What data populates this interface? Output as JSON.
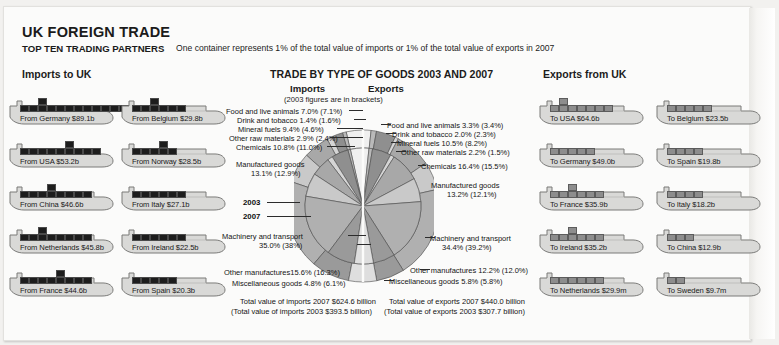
{
  "header": {
    "title": "UK FOREIGN TRADE",
    "subtitle_bold": "TOP TEN TRADING PARTNERS",
    "subtitle_rest": "One container represents 1% of the total value of imports or 1% of the total value of exports in 2007",
    "imports_heading": "Imports to UK",
    "exports_heading": "Exports from UK"
  },
  "chart_header": {
    "title": "TRADE BY TYPE OF GOODS 2003 AND 2007",
    "imports_label": "Imports",
    "exports_label": "Exports",
    "note": "(2003 figures are in brackets)",
    "year_inner": "2007",
    "year_outer": "2003"
  },
  "imports_ships": [
    {
      "label": "From Germany $89.1b",
      "value": 89.1,
      "containers": 13,
      "peak_col": 2,
      "peak_extra": 1
    },
    {
      "label": "From USA $53.2b",
      "value": 53.2,
      "containers": 9,
      "peak_col": 5,
      "peak_extra": 1
    },
    {
      "label": "From China $46.6b",
      "value": 46.6,
      "containers": 8,
      "peak_col": 3,
      "peak_extra": 1
    },
    {
      "label": "From Netherlands $45.8b",
      "value": 45.8,
      "containers": 8,
      "peak_col": 2,
      "peak_extra": 1
    },
    {
      "label": "From France $44.6b",
      "value": 44.6,
      "containers": 8,
      "peak_col": 4,
      "peak_extra": 1
    },
    {
      "label": "From Belgium $29.8b",
      "value": 29.8,
      "containers": 6,
      "peak_col": 2,
      "peak_extra": 1
    },
    {
      "label": "From Norway $28.5b",
      "value": 28.5,
      "containers": 5,
      "peak_col": 3,
      "peak_extra": 1
    },
    {
      "label": "From Italy $27.1b",
      "value": 27.1,
      "containers": 6,
      "peak_col": 0,
      "peak_extra": 0
    },
    {
      "label": "From Ireland $22.5b",
      "value": 22.5,
      "containers": 6,
      "peak_col": 0,
      "peak_extra": 0
    },
    {
      "label": "From Spain $20.3b",
      "value": 20.3,
      "containers": 5,
      "peak_col": 0,
      "peak_extra": 0
    }
  ],
  "exports_ships": [
    {
      "label": "To USA $64.6b",
      "value": 64.6,
      "containers": 7,
      "peak_col": 1,
      "peak_extra": 1
    },
    {
      "label": "To Germany $49.0b",
      "value": 49.0,
      "containers": 5,
      "peak_col": 0,
      "peak_extra": 0
    },
    {
      "label": "To France $35.9b",
      "value": 35.9,
      "containers": 6,
      "peak_col": 2,
      "peak_extra": 1
    },
    {
      "label": "To Ireland $35.2b",
      "value": 35.2,
      "containers": 6,
      "peak_col": 2,
      "peak_extra": 1
    },
    {
      "label": "To Netherlands $29.9m",
      "value": 29.9,
      "containers": 6,
      "peak_col": 0,
      "peak_extra": 0
    },
    {
      "label": "To Belgium $23.5b",
      "value": 23.5,
      "containers": 5,
      "peak_col": 0,
      "peak_extra": 0
    },
    {
      "label": "To Spain $19.8b",
      "value": 19.8,
      "containers": 4,
      "peak_col": 0,
      "peak_extra": 0
    },
    {
      "label": "To Italy $18.2b",
      "value": 18.2,
      "containers": 4,
      "peak_col": 0,
      "peak_extra": 0
    },
    {
      "label": "To China $12.9b",
      "value": 12.9,
      "containers": 3,
      "peak_col": 0,
      "peak_extra": 0
    },
    {
      "label": "To Sweden $9.7m",
      "value": 9.7,
      "containers": 2,
      "peak_col": 0,
      "peak_extra": 0
    }
  ],
  "import_labels": [
    "Food and live animals 7.0% (7.1%)",
    "Drink and tobacco 1.4% (1.6%)",
    "Mineral fuels 9.4% (4.6%)",
    "Other raw materials 2.9% (2.4%)",
    "Chemicals 10.8% (11.0%)",
    "Manufactured goods",
    "13.1% (12.9%)",
    "Machinery and transport",
    "35.0% (38%)",
    "Other manufactures15.6% (16.3%)",
    "Miscellaneous goods 4.8% (6.1%)"
  ],
  "export_labels": [
    "Food and live animals 3.3% (3.4%)",
    "Drink and tobacco 2.0% (2.3%)",
    "Mineral fuels 10.5% (8.2%)",
    "Other raw materials 2.2% (1.5%)",
    "Chemicals 16.4% (15.5%)",
    "Manufactured goods",
    "13.2% (12.1%)",
    "Machinery and transport",
    "34.4% (39.2%)",
    "Other manufactures 12.2% (12.0%)",
    "Miscellaneous goods 5.8% (5.8%)"
  ],
  "totals": {
    "imports_2007": "Total value of imports 2007 $624.6 billion",
    "imports_2003": "(Total value of imports 2003 $393.5 billion)",
    "exports_2007": "Total value of exports 2007 $440.0 billion",
    "exports_2003": "(Total value of exports 2003 $307.7 billion)"
  },
  "chart_data": {
    "type": "pie",
    "title": "TRADE BY TYPE OF GOODS 2003 AND 2007",
    "note": "(2003 figures are in brackets)",
    "layout": "split double-ring pie; left half = Imports, right half = Exports; inner ring = 2007, outer ring = 2003",
    "categories": [
      "Food and live animals",
      "Drink and tobacco",
      "Mineral fuels",
      "Other raw materials",
      "Chemicals",
      "Manufactured goods",
      "Machinery and transport",
      "Other manufactures",
      "Miscellaneous goods"
    ],
    "series": [
      {
        "name": "Imports 2007",
        "values": [
          7.0,
          1.4,
          9.4,
          2.9,
          10.8,
          13.1,
          35.0,
          15.6,
          4.8
        ]
      },
      {
        "name": "Imports 2003",
        "values": [
          7.1,
          1.6,
          4.6,
          2.4,
          11.0,
          12.9,
          38.0,
          16.3,
          6.1
        ]
      },
      {
        "name": "Exports 2007",
        "values": [
          3.3,
          2.0,
          10.5,
          2.2,
          16.4,
          13.2,
          34.4,
          12.2,
          5.8
        ]
      },
      {
        "name": "Exports 2003",
        "values": [
          3.4,
          2.3,
          8.2,
          1.5,
          15.5,
          12.1,
          39.2,
          12.0,
          5.8
        ]
      }
    ],
    "slice_colors": [
      "#efefef",
      "#b9b9b9",
      "#8f8f8f",
      "#d5d5d5",
      "#a8a8a8",
      "#c9c9c9",
      "#b0b0b0",
      "#9a9a9a",
      "#dedede"
    ],
    "totals": {
      "imports_2007_usd_billion": 624.6,
      "imports_2003_usd_billion": 393.5,
      "exports_2007_usd_billion": 440.0,
      "exports_2003_usd_billion": 307.7
    }
  }
}
